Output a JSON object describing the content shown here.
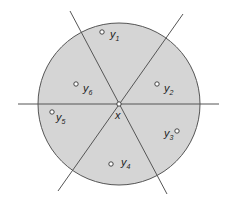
{
  "diagram": {
    "center": {
      "x": 119,
      "y": 104,
      "label": "x"
    },
    "circle": {
      "radius": 81,
      "fill": "#d5d5d5",
      "stroke": "#555555"
    },
    "lines": [
      {
        "x1": 18,
        "y1": 104,
        "x2": 219,
        "y2": 104
      },
      {
        "x1": 70,
        "y1": 11,
        "x2": 167,
        "y2": 194
      },
      {
        "x1": 183,
        "y1": 14,
        "x2": 58,
        "y2": 191
      }
    ],
    "points": [
      {
        "id": "y1",
        "base": "y",
        "sub": "1",
        "cx": 102,
        "cy": 32,
        "lx": 110,
        "ly": 38
      },
      {
        "id": "y2",
        "base": "y",
        "sub": "2",
        "cx": 157,
        "cy": 84,
        "lx": 164,
        "ly": 92
      },
      {
        "id": "y3",
        "base": "y",
        "sub": "3",
        "cx": 177,
        "cy": 131,
        "lx": 164,
        "ly": 137
      },
      {
        "id": "y4",
        "base": "y",
        "sub": "4",
        "cx": 111,
        "cy": 164,
        "lx": 121,
        "ly": 166
      },
      {
        "id": "y5",
        "base": "y",
        "sub": "5",
        "cx": 52,
        "cy": 112,
        "lx": 56,
        "ly": 121
      },
      {
        "id": "y6",
        "base": "y",
        "sub": "6",
        "cx": 76,
        "cy": 84,
        "lx": 83,
        "ly": 92
      }
    ]
  }
}
